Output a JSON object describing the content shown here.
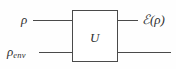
{
  "figure": {
    "type": "quantum-circuit-diagram",
    "background_color": "#fefefe",
    "line_color": "#4a4a4a",
    "text_color": "#2e2e2e"
  },
  "gate": {
    "label": "U",
    "name": "unitary-gate"
  },
  "inputs": {
    "top": {
      "symbol": "ρ",
      "subscript": ""
    },
    "bottom": {
      "symbol": "ρ",
      "subscript": "env"
    }
  },
  "outputs": {
    "top": {
      "script_symbol": "ℰ",
      "argument": "(ρ)",
      "full": "ℰ(ρ)"
    },
    "bottom": {
      "full": ""
    }
  },
  "wires": {
    "input_top_label": "input wire rho",
    "input_bottom_label": "input wire rho env",
    "output_top_label": "output wire E of rho",
    "output_bottom_label": "output wire environment"
  }
}
